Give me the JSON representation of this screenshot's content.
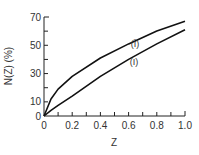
{
  "chart_data": {
    "type": "line",
    "title": "",
    "xlabel": "Z",
    "ylabel": "N(Z) (%)",
    "xlim": [
      0,
      1.0
    ],
    "ylim": [
      0,
      70
    ],
    "grid": false,
    "x_ticks": [
      "0",
      "0.2",
      "0.4",
      "0.6",
      "0.8",
      "1.0"
    ],
    "y_ticks": [
      "0",
      "10",
      "30",
      "50",
      "70"
    ],
    "x": [
      0,
      0.05,
      0.1,
      0.2,
      0.4,
      0.6,
      0.8,
      1.0
    ],
    "series": [
      {
        "name": "(Ī)",
        "values": [
          0,
          12,
          19,
          28,
          41,
          51,
          60,
          67
        ]
      },
      {
        "name": "(I)",
        "values": [
          0,
          4,
          7.5,
          14,
          28,
          40,
          51,
          61
        ]
      }
    ],
    "annotations": [
      "(Ī)",
      "(I)"
    ]
  }
}
